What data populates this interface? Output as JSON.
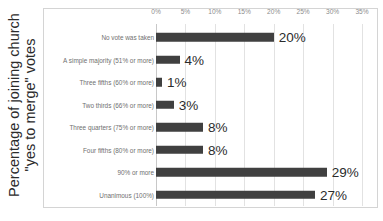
{
  "chart_data": {
    "type": "bar",
    "orientation": "horizontal",
    "title": "",
    "xlabel": "",
    "ylabel": "Percentage of joining church \"yes to merge\" votes",
    "ylabel_lines": [
      "Percentage of  joining church",
      "\"yes to merge\" votes"
    ],
    "categories": [
      "No vote was taken",
      "A simple majority (51% or more)",
      "Three fifths (60% or more)",
      "Two thirds (66% or more)",
      "Three quarters (75% or more)",
      "Four fifths (80% or more)",
      "90% or more",
      "Unanimous (100%)"
    ],
    "values": [
      20,
      4,
      1,
      3,
      8,
      8,
      29,
      27
    ],
    "value_labels": [
      "20%",
      "4%",
      "1%",
      "3%",
      "8%",
      "8%",
      "29%",
      "27%"
    ],
    "xlim": [
      0,
      35
    ],
    "xticks": [
      0,
      5,
      10,
      15,
      20,
      25,
      30,
      35
    ],
    "xtick_labels": [
      "0%",
      "5%",
      "10%",
      "15%",
      "20%",
      "25%",
      "30%",
      "35%"
    ],
    "grid": true,
    "grid_axis": "x",
    "legend": false,
    "bar_color": "#404040",
    "grid_color": "#e2e2e2",
    "frame_color": "#d4d4d4",
    "background_color": "#ffffff",
    "tick_label_color": "#8c8c8c",
    "category_label_color": "#6f6f6f",
    "value_label_color": "#2b2b2b"
  }
}
